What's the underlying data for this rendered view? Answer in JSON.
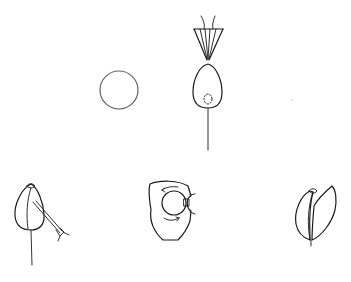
{
  "figure": {
    "type": "line-drawing",
    "background": "#ffffff",
    "stroke_color": "#1a1a1a",
    "panels": [
      {
        "id": "circle",
        "description": "plain circle (e.g. cell / disk)"
      },
      {
        "id": "funnel-over-bud",
        "description": "fan / funnel of lines with two filaments above an ovoid bud with dashed inner circle on a stem"
      },
      {
        "id": "bud-with-instrument",
        "description": "ovoid bud on stem with a probe / needle inserted diagonally"
      },
      {
        "id": "rotation-cross-section",
        "description": "cross-section with inner circle and curved rotation arrows"
      },
      {
        "id": "split-bud",
        "description": "bud with one leaf / petal splitting open"
      }
    ],
    "labels": []
  }
}
